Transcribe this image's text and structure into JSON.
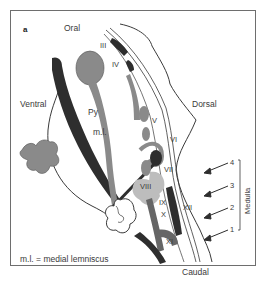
{
  "panel_label": "a",
  "orientation": {
    "top": "Oral",
    "bottom": "Caudal",
    "left": "Ventral",
    "right": "Dorsal"
  },
  "structures": {
    "pyramidal_tract": "Py",
    "medial_lemniscus": "m.l."
  },
  "cranial_nerves": [
    "III",
    "IV",
    "V",
    "VI",
    "VII",
    "VIII",
    "IX",
    "X",
    "XI",
    "XII"
  ],
  "levels": [
    "4",
    "3",
    "2",
    "1"
  ],
  "bracket_label": "Medulla",
  "legend": "m.l. = medial lemniscus",
  "colors": {
    "dark": "#2e2e2e",
    "mid_gray": "#8a8a8a",
    "light_gray": "#bdbdbd",
    "outline": "#3a3a3a",
    "frame": "#6e6e6e"
  }
}
